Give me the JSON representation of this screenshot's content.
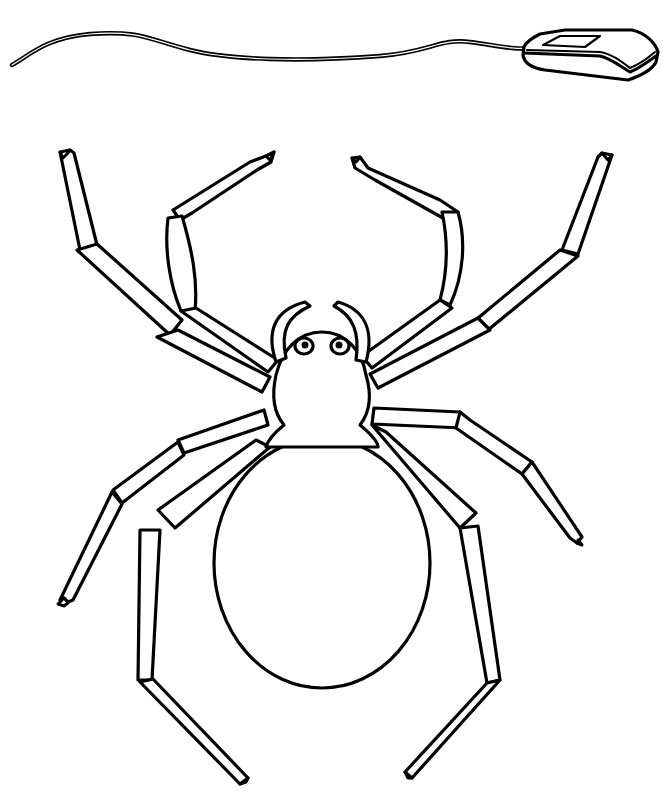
{
  "illustration": {
    "style": "black-and-white line art coloring page",
    "colors": {
      "ink": "#000000",
      "paper": "#ffffff"
    },
    "subjects": [
      {
        "id": "computer-mouse",
        "label": "computer mouse with cord"
      },
      {
        "id": "spider",
        "label": "spider",
        "legs": 8,
        "pedipalps": 2,
        "eyes": 2
      }
    ]
  }
}
